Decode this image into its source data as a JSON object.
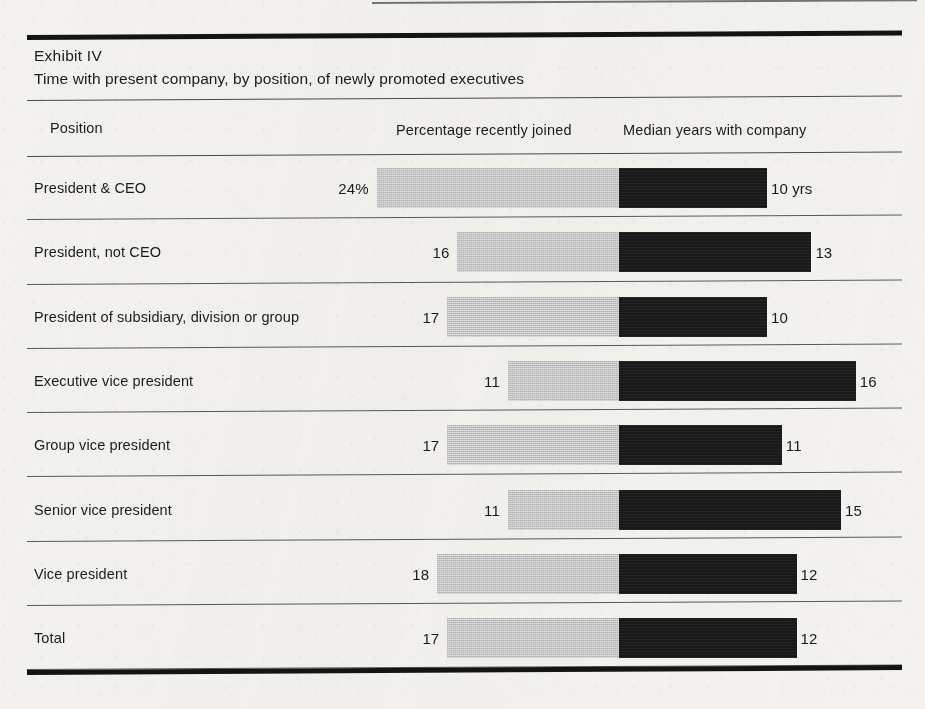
{
  "exhibit": {
    "label": "Exhibit IV",
    "subtitle": "Time with present company, by position, of newly promoted executives"
  },
  "columns": {
    "position": "Position",
    "percentage": "Percentage recently joined",
    "median": "Median years with company"
  },
  "colors": {
    "paper": "#f3f2ee",
    "rule": "#141414",
    "bar_left": "#c2c2c2",
    "bar_right": "#191919",
    "text": "#1b1b1b"
  },
  "chart_data": {
    "type": "bar",
    "title": "Exhibit IV",
    "subtitle": "Time with present company, by position, of newly promoted executives",
    "orientation": "horizontal",
    "layout": "diverging-back-to-back",
    "xlabel": "",
    "ylabel": "Position",
    "grid": false,
    "legend_position": "column-headers",
    "categories": [
      "President & CEO",
      "President, not CEO",
      "President of subsidiary, division or group",
      "Executive vice president",
      "Group vice president",
      "Senior vice president",
      "Vice president",
      "Total"
    ],
    "series": [
      {
        "name": "Percentage recently joined",
        "unit": "%",
        "direction": "left",
        "color": "#c2c2c2",
        "values": [
          24,
          16,
          17,
          11,
          17,
          11,
          18,
          17
        ],
        "labels": [
          "24%",
          "16",
          "17",
          "11",
          "17",
          "11",
          "18",
          "17"
        ]
      },
      {
        "name": "Median years with company",
        "unit": "yrs",
        "direction": "right",
        "color": "#191919",
        "values": [
          10,
          13,
          10,
          16,
          11,
          15,
          12,
          12
        ],
        "labels": [
          "10 yrs",
          "13",
          "10",
          "16",
          "11",
          "15",
          "12",
          "12"
        ]
      }
    ],
    "rows": [
      {
        "position": "President & CEO",
        "percentage": 24,
        "percentage_label": "24%",
        "median_years": 10,
        "median_label": "10 yrs"
      },
      {
        "position": "President, not CEO",
        "percentage": 16,
        "percentage_label": "16",
        "median_years": 13,
        "median_label": "13"
      },
      {
        "position": "President of subsidiary, division or group",
        "percentage": 17,
        "percentage_label": "17",
        "median_years": 10,
        "median_label": "10"
      },
      {
        "position": "Executive vice president",
        "percentage": 11,
        "percentage_label": "11",
        "median_years": 16,
        "median_label": "16"
      },
      {
        "position": "Group vice president",
        "percentage": 17,
        "percentage_label": "17",
        "median_years": 11,
        "median_label": "11"
      },
      {
        "position": "Senior vice president",
        "percentage": 11,
        "percentage_label": "11",
        "median_years": 15,
        "median_label": "15"
      },
      {
        "position": "Vice president",
        "percentage": 18,
        "percentage_label": "18",
        "median_years": 12,
        "median_label": "12"
      },
      {
        "position": "Total",
        "percentage": 17,
        "percentage_label": "17",
        "median_years": 12,
        "median_label": "12"
      }
    ],
    "scale": {
      "divider_x": 619,
      "px_per_percent": 10.1,
      "px_per_year": 14.8
    }
  }
}
